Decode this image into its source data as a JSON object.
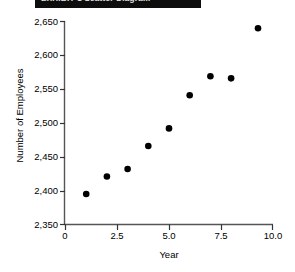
{
  "header": {
    "clipped_title": "EXHIBIT 1  Scatter Diagram"
  },
  "chart_data": {
    "type": "scatter",
    "title": "",
    "xlabel": "Year",
    "ylabel": "Number of Employees",
    "xlim": [
      0,
      10
    ],
    "ylim": [
      2350,
      2650
    ],
    "xticks": [
      "0",
      "2.5",
      "5.0",
      "7.5",
      "10.0"
    ],
    "xtick_values": [
      0,
      2.5,
      5.0,
      7.5,
      10.0
    ],
    "yticks": [
      "2,350",
      "2,400",
      "2,450",
      "2,500",
      "2,550",
      "2,600",
      "2,650"
    ],
    "ytick_values": [
      2350,
      2400,
      2450,
      2500,
      2550,
      2600,
      2650
    ],
    "grid": false,
    "legend": null,
    "marker": "filled-circle",
    "marker_color": "#000000",
    "x": [
      1,
      2,
      3,
      4,
      5,
      6,
      7,
      8,
      9.3
    ],
    "y": [
      2395,
      2421,
      2432,
      2466,
      2492,
      2541,
      2569,
      2566,
      2640
    ],
    "points": [
      {
        "x": 1,
        "y": 2395
      },
      {
        "x": 2,
        "y": 2421
      },
      {
        "x": 3,
        "y": 2432
      },
      {
        "x": 4,
        "y": 2466
      },
      {
        "x": 5,
        "y": 2492
      },
      {
        "x": 6,
        "y": 2541
      },
      {
        "x": 7,
        "y": 2569
      },
      {
        "x": 8,
        "y": 2566
      },
      {
        "x": 9.3,
        "y": 2640
      }
    ]
  }
}
